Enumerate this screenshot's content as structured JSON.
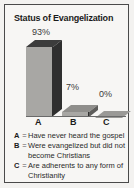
{
  "chart_data": {
    "type": "bar",
    "title": "Status of Evangelization",
    "categories": [
      "A",
      "B",
      "C"
    ],
    "values": [
      93,
      7,
      0
    ],
    "value_labels": [
      "93%",
      "7%",
      "0%"
    ],
    "xlabel": "",
    "ylabel": "",
    "ylim": [
      0,
      100
    ],
    "grid": false,
    "legend_position": "below",
    "style": "3d-bar",
    "legend": [
      {
        "key": "A",
        "eq": "=",
        "text": "Have never heard the gospel"
      },
      {
        "key": "B",
        "eq": "=",
        "text": "Were evangelized but did not become Christians"
      },
      {
        "key": "C",
        "eq": "=",
        "text": "Are adherents to any form of Christianity"
      }
    ],
    "colors": {
      "bar_front": "#a8a7a4",
      "bar_side": "#2f2f2f",
      "bar_top": "#3c3c3c",
      "background": "#f7f6f4",
      "border": "#4a4a4a",
      "text": "#1b1b1b"
    }
  }
}
